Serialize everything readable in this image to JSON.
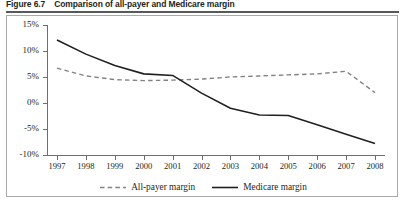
{
  "figure": {
    "number": "Figure 6.7",
    "title": "Comparison of all-payer and Medicare margin"
  },
  "chart_data": {
    "type": "line",
    "title": "Comparison of all-payer and Medicare margin",
    "xlabel": "",
    "ylabel": "",
    "x": [
      "1997",
      "1998",
      "1999",
      "2000",
      "2001",
      "2002",
      "2003",
      "2004",
      "2005",
      "2006",
      "2007",
      "2008"
    ],
    "ylim": [
      -10,
      15
    ],
    "yticks": [
      15,
      10,
      5,
      0,
      -5,
      -10
    ],
    "ytick_labels": [
      "15%",
      "10%",
      "5%",
      "0%",
      "-5%",
      "-10%"
    ],
    "grid": false,
    "legend_position": "bottom",
    "series": [
      {
        "name": "All-payer margin",
        "style": "dashed",
        "color": "#808285",
        "values": [
          6.7,
          5.2,
          4.5,
          4.3,
          4.4,
          4.6,
          5.0,
          5.2,
          5.4,
          5.6,
          6.1,
          2.0
        ]
      },
      {
        "name": "Medicare margin",
        "style": "solid",
        "color": "#231f20",
        "values": [
          12.1,
          9.4,
          7.2,
          5.6,
          5.3,
          1.9,
          -1.0,
          -2.3,
          -2.4,
          -4.2,
          -6.0,
          -7.8
        ]
      }
    ]
  },
  "legend": {
    "items": [
      {
        "label": "All-payer margin",
        "style": "dashed"
      },
      {
        "label": "Medicare margin",
        "style": "solid"
      }
    ]
  }
}
